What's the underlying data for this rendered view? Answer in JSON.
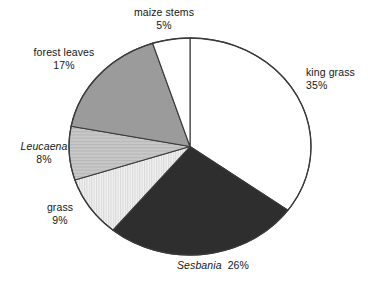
{
  "chart_data": {
    "type": "pie",
    "title": "",
    "xlabel": "",
    "ylabel": "",
    "units": "percent",
    "start_angle_deg": 0,
    "direction": "clockwise",
    "legend": "none",
    "grid": false,
    "labels_position": "outside",
    "categories": [
      "king grass",
      "Sesbania",
      "grass",
      "Leucaena",
      "forest leaves",
      "maize stems"
    ],
    "values": [
      35,
      26,
      9,
      8,
      17,
      5
    ],
    "slices": [
      {
        "name": "king grass",
        "label": "king grass",
        "value": 35,
        "value_text": "35%",
        "italic": false,
        "fill": "#ffffff",
        "pattern": "solid",
        "start_deg": 0,
        "end_deg": 126
      },
      {
        "name": "Sesbania",
        "label": "Sesbania",
        "value": 26,
        "value_text": "26%",
        "italic": true,
        "fill": "#2e2e2e",
        "pattern": "solid",
        "start_deg": 126,
        "end_deg": 219.6
      },
      {
        "name": "grass",
        "label": "grass",
        "value": 9,
        "value_text": "9%",
        "italic": false,
        "fill": "#ececec",
        "pattern": "vertical-hatch",
        "start_deg": 219.6,
        "end_deg": 252
      },
      {
        "name": "Leucaena",
        "label": "Leucaena",
        "value": 8,
        "value_text": "8%",
        "italic": true,
        "fill": "#c4c4c4",
        "pattern": "horizontal-hatch",
        "start_deg": 252,
        "end_deg": 280.8
      },
      {
        "name": "forest leaves",
        "label": "forest leaves",
        "value": 17,
        "value_text": "17%",
        "italic": false,
        "fill": "#9b9b9b",
        "pattern": "solid",
        "start_deg": 280.8,
        "end_deg": 342
      },
      {
        "name": "maize stems",
        "label": "maize stems",
        "value": 5,
        "value_text": "5%",
        "italic": false,
        "fill": "#ffffff",
        "pattern": "solid",
        "start_deg": 342,
        "end_deg": 360
      }
    ],
    "colors": {
      "outline": "#3a3a3a",
      "text": "#161616",
      "background": "#ffffff"
    }
  }
}
